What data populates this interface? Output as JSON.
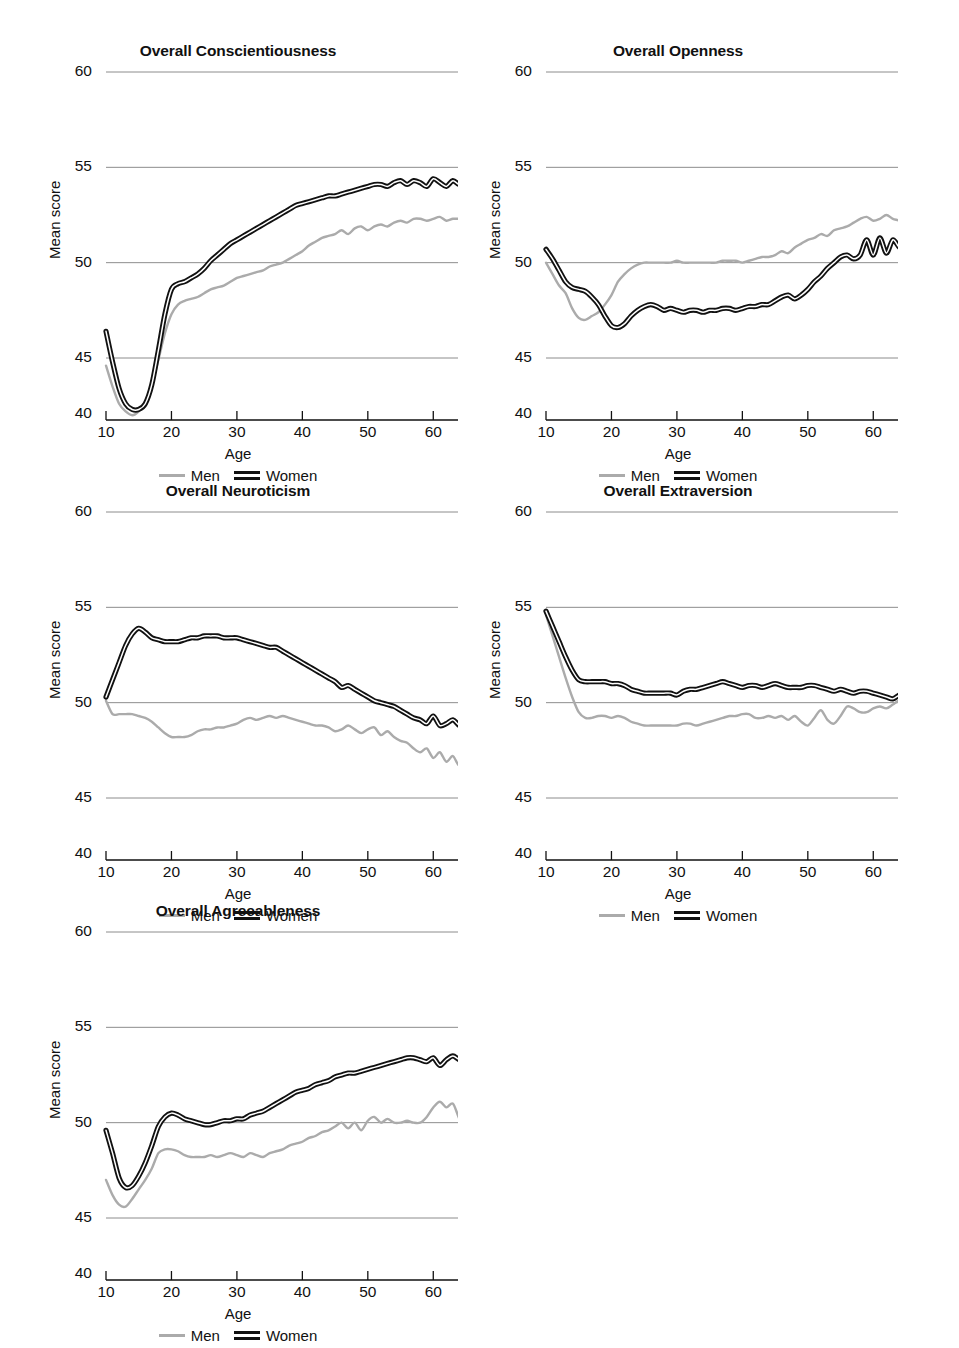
{
  "figure": {
    "series_names": [
      "Men",
      "Women"
    ],
    "colors": {
      "men": "#ababab",
      "women": "#111111",
      "grid": "#808080",
      "axis": "#111111"
    },
    "xlabel": "Age",
    "ylabel": "Mean score",
    "legend_position": "below-axis",
    "grid": "horizontal-only",
    "xlim": [
      10,
      65
    ],
    "ylim": [
      40,
      60
    ],
    "yticks": [
      "60",
      "55",
      "50",
      "45",
      "40"
    ],
    "xticks": [
      "10",
      "20",
      "30",
      "40",
      "50",
      "60"
    ]
  },
  "chart_data": [
    {
      "type": "line",
      "title": "Overall Conscientiousness",
      "xlabel": "Age",
      "ylabel": "Mean score",
      "xlim": [
        10,
        65
      ],
      "ylim": [
        40,
        60
      ],
      "yticks": [
        60,
        55,
        50,
        45,
        40
      ],
      "xticks": [
        10,
        20,
        30,
        40,
        50,
        60
      ],
      "x": [
        10,
        11,
        12,
        13,
        14,
        15,
        16,
        17,
        18,
        19,
        20,
        21,
        22,
        23,
        24,
        25,
        26,
        27,
        28,
        29,
        30,
        31,
        32,
        33,
        34,
        35,
        36,
        37,
        38,
        39,
        40,
        41,
        42,
        43,
        44,
        45,
        46,
        47,
        48,
        49,
        50,
        51,
        52,
        53,
        54,
        55,
        56,
        57,
        58,
        59,
        60,
        61,
        62,
        63,
        64,
        65
      ],
      "series": [
        {
          "name": "Men",
          "values": [
            44.6,
            43.5,
            42.6,
            42.2,
            42.0,
            42.2,
            42.7,
            43.6,
            44.9,
            46.3,
            47.3,
            47.8,
            48.0,
            48.1,
            48.2,
            48.4,
            48.6,
            48.7,
            48.8,
            49.0,
            49.2,
            49.3,
            49.4,
            49.5,
            49.6,
            49.8,
            49.9,
            50.0,
            50.2,
            50.4,
            50.6,
            50.9,
            51.1,
            51.3,
            51.4,
            51.5,
            51.7,
            51.5,
            51.8,
            51.9,
            51.7,
            51.9,
            52.0,
            51.9,
            52.1,
            52.2,
            52.1,
            52.3,
            52.3,
            52.2,
            52.3,
            52.4,
            52.2,
            52.3,
            52.3,
            52.3
          ]
        },
        {
          "name": "Women",
          "values": [
            46.4,
            44.8,
            43.4,
            42.6,
            42.3,
            42.3,
            42.6,
            43.6,
            45.4,
            47.3,
            48.6,
            48.9,
            49.0,
            49.2,
            49.4,
            49.7,
            50.1,
            50.4,
            50.7,
            51.0,
            51.2,
            51.4,
            51.6,
            51.8,
            52.0,
            52.2,
            52.4,
            52.6,
            52.8,
            53.0,
            53.1,
            53.2,
            53.3,
            53.4,
            53.5,
            53.5,
            53.6,
            53.7,
            53.8,
            53.9,
            54.0,
            54.1,
            54.1,
            54.0,
            54.2,
            54.3,
            54.1,
            54.3,
            54.2,
            54.0,
            54.4,
            54.2,
            54.0,
            54.3,
            54.1,
            54.3
          ]
        }
      ]
    },
    {
      "type": "line",
      "title": "Overall Openness",
      "xlabel": "Age",
      "ylabel": "Mean score",
      "xlim": [
        10,
        65
      ],
      "ylim": [
        40,
        60
      ],
      "yticks": [
        60,
        55,
        50,
        45,
        40
      ],
      "xticks": [
        10,
        20,
        30,
        40,
        50,
        60
      ],
      "x": [
        10,
        11,
        12,
        13,
        14,
        15,
        16,
        17,
        18,
        19,
        20,
        21,
        22,
        23,
        24,
        25,
        26,
        27,
        28,
        29,
        30,
        31,
        32,
        33,
        34,
        35,
        36,
        37,
        38,
        39,
        40,
        41,
        42,
        43,
        44,
        45,
        46,
        47,
        48,
        49,
        50,
        51,
        52,
        53,
        54,
        55,
        56,
        57,
        58,
        59,
        60,
        61,
        62,
        63,
        64,
        65
      ],
      "series": [
        {
          "name": "Men",
          "values": [
            50.0,
            49.4,
            48.8,
            48.4,
            47.6,
            47.1,
            47.0,
            47.2,
            47.4,
            47.8,
            48.3,
            49.0,
            49.4,
            49.7,
            49.9,
            50.0,
            50.0,
            50.0,
            50.0,
            50.0,
            50.1,
            50.0,
            50.0,
            50.0,
            50.0,
            50.0,
            50.0,
            50.1,
            50.1,
            50.1,
            50.0,
            50.1,
            50.2,
            50.3,
            50.3,
            50.4,
            50.6,
            50.5,
            50.8,
            51.0,
            51.2,
            51.3,
            51.5,
            51.4,
            51.7,
            51.8,
            51.9,
            52.1,
            52.3,
            52.4,
            52.2,
            52.3,
            52.5,
            52.3,
            52.2,
            52.0
          ]
        },
        {
          "name": "Women",
          "values": [
            50.7,
            50.2,
            49.6,
            49.0,
            48.7,
            48.6,
            48.5,
            48.2,
            47.8,
            47.2,
            46.7,
            46.6,
            46.8,
            47.2,
            47.5,
            47.7,
            47.8,
            47.7,
            47.5,
            47.6,
            47.5,
            47.4,
            47.5,
            47.5,
            47.4,
            47.5,
            47.5,
            47.6,
            47.6,
            47.5,
            47.6,
            47.7,
            47.7,
            47.8,
            47.8,
            48.0,
            48.2,
            48.3,
            48.1,
            48.3,
            48.6,
            49.0,
            49.3,
            49.7,
            50.0,
            50.3,
            50.4,
            50.2,
            50.4,
            51.2,
            50.4,
            51.3,
            50.5,
            51.2,
            50.8,
            50.8
          ]
        }
      ]
    },
    {
      "type": "line",
      "title": "Overall Neuroticism",
      "xlabel": "Age",
      "ylabel": "Mean score",
      "xlim": [
        10,
        65
      ],
      "ylim": [
        40,
        60
      ],
      "yticks": [
        60,
        55,
        50,
        45,
        40
      ],
      "xticks": [
        10,
        20,
        30,
        40,
        50,
        60
      ],
      "x": [
        10,
        11,
        12,
        13,
        14,
        15,
        16,
        17,
        18,
        19,
        20,
        21,
        22,
        23,
        24,
        25,
        26,
        27,
        28,
        29,
        30,
        31,
        32,
        33,
        34,
        35,
        36,
        37,
        38,
        39,
        40,
        41,
        42,
        43,
        44,
        45,
        46,
        47,
        48,
        49,
        50,
        51,
        52,
        53,
        54,
        55,
        56,
        57,
        58,
        59,
        60,
        61,
        62,
        63,
        64,
        65
      ],
      "series": [
        {
          "name": "Men",
          "values": [
            50.1,
            49.4,
            49.4,
            49.4,
            49.4,
            49.3,
            49.2,
            49.0,
            48.7,
            48.4,
            48.2,
            48.2,
            48.2,
            48.3,
            48.5,
            48.6,
            48.6,
            48.7,
            48.7,
            48.8,
            48.9,
            49.1,
            49.2,
            49.1,
            49.2,
            49.3,
            49.2,
            49.3,
            49.2,
            49.1,
            49.0,
            48.9,
            48.8,
            48.8,
            48.7,
            48.5,
            48.6,
            48.8,
            48.6,
            48.4,
            48.6,
            48.7,
            48.3,
            48.5,
            48.2,
            48.0,
            47.9,
            47.6,
            47.4,
            47.6,
            47.1,
            47.4,
            46.9,
            47.2,
            46.7,
            47.4
          ]
        },
        {
          "name": "Women",
          "values": [
            50.3,
            51.2,
            52.1,
            53.0,
            53.6,
            53.9,
            53.7,
            53.4,
            53.3,
            53.2,
            53.2,
            53.2,
            53.3,
            53.4,
            53.4,
            53.5,
            53.5,
            53.5,
            53.4,
            53.4,
            53.4,
            53.3,
            53.2,
            53.1,
            53.0,
            52.9,
            52.9,
            52.7,
            52.5,
            52.3,
            52.1,
            51.9,
            51.7,
            51.5,
            51.3,
            51.1,
            50.8,
            50.9,
            50.7,
            50.5,
            50.3,
            50.1,
            50.0,
            49.9,
            49.8,
            49.6,
            49.4,
            49.2,
            49.1,
            48.9,
            49.3,
            48.8,
            48.9,
            49.1,
            48.8,
            48.7
          ]
        }
      ]
    },
    {
      "type": "line",
      "title": "Overall Extraversion",
      "xlabel": "Age",
      "ylabel": "Mean score",
      "xlim": [
        10,
        65
      ],
      "ylim": [
        40,
        60
      ],
      "yticks": [
        60,
        55,
        50,
        45,
        40
      ],
      "xticks": [
        10,
        20,
        30,
        40,
        50,
        60
      ],
      "x": [
        10,
        11,
        12,
        13,
        14,
        15,
        16,
        17,
        18,
        19,
        20,
        21,
        22,
        23,
        24,
        25,
        26,
        27,
        28,
        29,
        30,
        31,
        32,
        33,
        34,
        35,
        36,
        37,
        38,
        39,
        40,
        41,
        42,
        43,
        44,
        45,
        46,
        47,
        48,
        49,
        50,
        51,
        52,
        53,
        54,
        55,
        56,
        57,
        58,
        59,
        60,
        61,
        62,
        63,
        64,
        65
      ],
      "series": [
        {
          "name": "Men",
          "values": [
            54.6,
            53.5,
            52.4,
            51.3,
            50.3,
            49.5,
            49.2,
            49.2,
            49.3,
            49.3,
            49.2,
            49.3,
            49.2,
            49.0,
            48.9,
            48.8,
            48.8,
            48.8,
            48.8,
            48.8,
            48.8,
            48.9,
            48.9,
            48.8,
            48.9,
            49.0,
            49.1,
            49.2,
            49.3,
            49.3,
            49.4,
            49.4,
            49.2,
            49.2,
            49.3,
            49.2,
            49.3,
            49.1,
            49.3,
            49.0,
            48.8,
            49.2,
            49.6,
            49.1,
            48.9,
            49.3,
            49.8,
            49.7,
            49.5,
            49.5,
            49.7,
            49.8,
            49.7,
            49.9,
            50.1,
            49.8
          ]
        },
        {
          "name": "Women",
          "values": [
            54.8,
            54.0,
            53.2,
            52.4,
            51.7,
            51.2,
            51.1,
            51.1,
            51.1,
            51.1,
            51.0,
            51.0,
            50.9,
            50.7,
            50.6,
            50.5,
            50.5,
            50.5,
            50.5,
            50.5,
            50.4,
            50.6,
            50.7,
            50.7,
            50.8,
            50.9,
            51.0,
            51.1,
            51.0,
            50.9,
            50.8,
            50.9,
            50.9,
            50.8,
            50.9,
            51.0,
            50.9,
            50.8,
            50.8,
            50.8,
            50.9,
            50.9,
            50.8,
            50.7,
            50.6,
            50.7,
            50.6,
            50.5,
            50.6,
            50.6,
            50.5,
            50.4,
            50.3,
            50.2,
            50.4,
            50.5
          ]
        }
      ]
    },
    {
      "type": "line",
      "title": "Overall Agreeableness",
      "xlabel": "Age",
      "ylabel": "Mean score",
      "xlim": [
        10,
        65
      ],
      "ylim": [
        40,
        60
      ],
      "yticks": [
        60,
        55,
        50,
        45,
        40
      ],
      "xticks": [
        10,
        20,
        30,
        40,
        50,
        60
      ],
      "x": [
        10,
        11,
        12,
        13,
        14,
        15,
        16,
        17,
        18,
        19,
        20,
        21,
        22,
        23,
        24,
        25,
        26,
        27,
        28,
        29,
        30,
        31,
        32,
        33,
        34,
        35,
        36,
        37,
        38,
        39,
        40,
        41,
        42,
        43,
        44,
        45,
        46,
        47,
        48,
        49,
        50,
        51,
        52,
        53,
        54,
        55,
        56,
        57,
        58,
        59,
        60,
        61,
        62,
        63,
        64,
        65
      ],
      "series": [
        {
          "name": "Men",
          "values": [
            47.0,
            46.2,
            45.7,
            45.6,
            46.0,
            46.5,
            47.0,
            47.6,
            48.4,
            48.6,
            48.6,
            48.5,
            48.3,
            48.2,
            48.2,
            48.2,
            48.3,
            48.2,
            48.3,
            48.4,
            48.3,
            48.2,
            48.4,
            48.3,
            48.2,
            48.4,
            48.5,
            48.6,
            48.8,
            48.9,
            49.0,
            49.2,
            49.3,
            49.5,
            49.6,
            49.8,
            50.0,
            49.7,
            50.0,
            49.6,
            50.1,
            50.3,
            50.0,
            50.2,
            50.0,
            50.0,
            50.1,
            50.0,
            50.0,
            50.3,
            50.8,
            51.1,
            50.8,
            51.0,
            50.2,
            49.8
          ]
        },
        {
          "name": "Women",
          "values": [
            49.6,
            48.4,
            47.1,
            46.6,
            46.7,
            47.2,
            47.9,
            48.8,
            49.8,
            50.3,
            50.5,
            50.4,
            50.2,
            50.1,
            50.0,
            49.9,
            49.9,
            50.0,
            50.1,
            50.1,
            50.2,
            50.2,
            50.4,
            50.5,
            50.6,
            50.8,
            51.0,
            51.2,
            51.4,
            51.6,
            51.7,
            51.8,
            52.0,
            52.1,
            52.2,
            52.4,
            52.5,
            52.6,
            52.6,
            52.7,
            52.8,
            52.9,
            53.0,
            53.1,
            53.2,
            53.3,
            53.4,
            53.4,
            53.3,
            53.2,
            53.4,
            53.0,
            53.3,
            53.5,
            53.3,
            53.2
          ]
        }
      ]
    }
  ]
}
